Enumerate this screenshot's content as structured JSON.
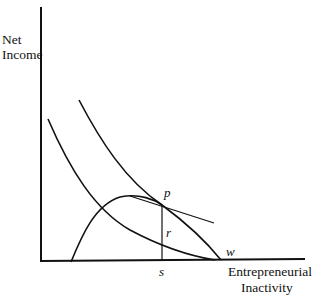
{
  "diagram": {
    "y_axis_label_line1": "Net",
    "y_axis_label_line2": "Income",
    "x_axis_label_line1": "Entrepreneurial",
    "x_axis_label_line2": "Inactivity",
    "points": {
      "p": "p",
      "r": "r",
      "s": "s",
      "w": "w"
    },
    "elements": [
      "upper indifference curve tangent at p",
      "lower indifference curve",
      "hump-shaped net income curve ending at w",
      "tangent line through p",
      "vertical segment from p to s on x-axis"
    ]
  }
}
